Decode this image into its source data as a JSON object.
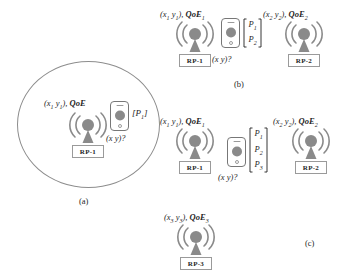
{
  "figure": {
    "panels": [
      {
        "id": "a",
        "caption": "(a)",
        "coverage_shape": "circle",
        "rps": [
          {
            "name": "RP-1",
            "coord_label": "(x",
            "coord_sub1": "1",
            "coord_mid": "y",
            "coord_sub2": "1",
            "coord_tail": "), ",
            "qoe_label": "QoE",
            "qoe_sub": "",
            "icon": "antenna-icon"
          }
        ],
        "phone": {
          "icon": "smartphone-icon",
          "query_label": "(x  y)?",
          "fingerprints": [
            {
              "p": "P",
              "sub": "1"
            }
          ]
        }
      },
      {
        "id": "b",
        "caption": "(b)",
        "rps": [
          {
            "name": "RP-1",
            "coord_label": "(x",
            "coord_sub1": "1",
            "coord_mid": "y",
            "coord_sub2": "1",
            "coord_tail": "), ",
            "qoe_label": "QoE",
            "qoe_sub": "1",
            "icon": "antenna-icon"
          },
          {
            "name": "RP-2",
            "coord_label": "(x",
            "coord_sub1": "2",
            "coord_mid": "y",
            "coord_sub2": "2",
            "coord_tail": "), ",
            "qoe_label": "QoE",
            "qoe_sub": "2",
            "icon": "antenna-icon"
          }
        ],
        "phone": {
          "icon": "smartphone-icon",
          "query_label": "(x  y)?",
          "fingerprints": [
            {
              "p": "P",
              "sub": "1"
            },
            {
              "p": "P",
              "sub": "2"
            }
          ]
        }
      },
      {
        "id": "c",
        "caption": "(c)",
        "rps": [
          {
            "name": "RP-1",
            "coord_label": "(x",
            "coord_sub1": "1",
            "coord_mid": "y",
            "coord_sub2": "1",
            "coord_tail": "), ",
            "qoe_label": "QoE",
            "qoe_sub": "1",
            "icon": "antenna-icon"
          },
          {
            "name": "RP-2",
            "coord_label": "(x",
            "coord_sub1": "2",
            "coord_mid": "y",
            "coord_sub2": "2",
            "coord_tail": "), ",
            "qoe_label": "QoE",
            "qoe_sub": "2",
            "icon": "antenna-icon"
          },
          {
            "name": "RP-3",
            "coord_label": "(x",
            "coord_sub1": "3",
            "coord_mid": "y",
            "coord_sub2": "3",
            "coord_tail": "), ",
            "qoe_label": "QoE",
            "qoe_sub": "3",
            "icon": "antenna-icon"
          }
        ],
        "phone": {
          "icon": "smartphone-icon",
          "query_label": "(x  y)?",
          "fingerprints": [
            {
              "p": "P",
              "sub": "1"
            },
            {
              "p": "P",
              "sub": "2"
            },
            {
              "p": "P",
              "sub": "3"
            }
          ]
        }
      }
    ],
    "colors": {
      "antenna_fill": "#8a8a8a",
      "outline": "#777777",
      "circle_stroke": "#8d8d8d",
      "text": "#1f1f1f",
      "background": "#ffffff"
    }
  }
}
